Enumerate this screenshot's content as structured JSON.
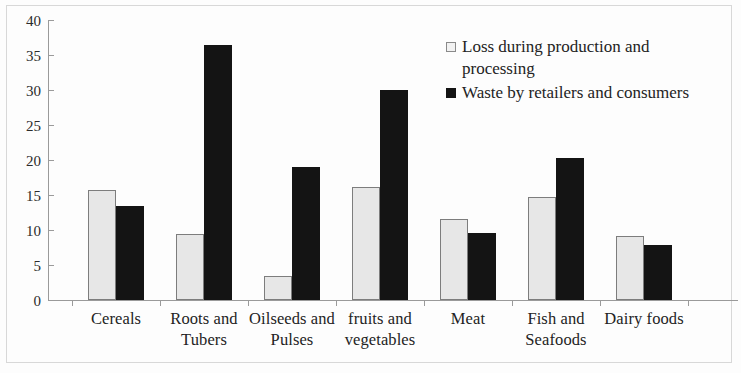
{
  "chart_data": {
    "type": "bar",
    "title": "",
    "subtitle": "",
    "xlabel": "",
    "ylabel": "",
    "ylim": [
      0,
      40
    ],
    "ytick_step": 5,
    "yticks": [
      40,
      35,
      30,
      25,
      20,
      15,
      10,
      5,
      0
    ],
    "grid": false,
    "legend_position": "top-right",
    "categories": [
      "Cereals",
      "Roots and Tubers",
      "Oilseeds and Pulses",
      "fruits and vegetables",
      "Meat",
      "Fish and Seafoods",
      "Dairy foods"
    ],
    "series": [
      {
        "name": "Loss during production and processing",
        "color": "#e7e7e7",
        "values": [
          15.7,
          9.5,
          3.4,
          16.1,
          11.6,
          14.7,
          9.2
        ]
      },
      {
        "name": "Waste by retailers and consumers",
        "color": "#141414",
        "values": [
          13.5,
          36.5,
          19.0,
          30.0,
          9.6,
          20.3,
          7.8
        ]
      }
    ]
  },
  "legend": {
    "items": [
      {
        "label": "Loss during production and processing",
        "swatch": "light-square-icon"
      },
      {
        "label": "Waste by retailers and consumers",
        "swatch": "dark-square-icon"
      }
    ]
  },
  "axis": {
    "y_labels": [
      "40",
      "35",
      "30",
      "25",
      "20",
      "15",
      "10",
      "5",
      "0"
    ],
    "x_labels": [
      "Cereals",
      "Roots and Tubers",
      "Oilseeds and Pulses",
      "fruits and vegetables",
      "Meat",
      "Fish and Seafoods",
      "Dairy foods"
    ]
  }
}
